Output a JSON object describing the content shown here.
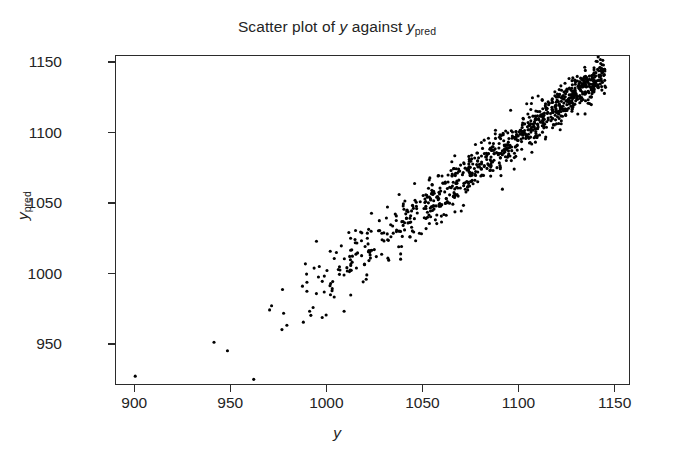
{
  "chart_data": {
    "type": "scatter",
    "title_parts": {
      "prefix": "Scatter plot of ",
      "var1": "y",
      "middle": " against ",
      "var2": "y",
      "var2_sub": "pred"
    },
    "xlabel": "y",
    "ylabel": "y_pred",
    "ylabel_parts": {
      "base": "y",
      "sub": "pred"
    },
    "xlim": [
      890,
      1158
    ],
    "ylim": [
      921,
      1155
    ],
    "xticks": [
      900,
      950,
      1000,
      1050,
      1100,
      1150
    ],
    "xticklabels": [
      "900",
      "950",
      "1000",
      "1050",
      "1100",
      "1150"
    ],
    "yticks": [
      950,
      1000,
      1050,
      1100,
      1150
    ],
    "yticklabels": [
      "950",
      "1000",
      "1050",
      "1100",
      "1150"
    ],
    "grid": false,
    "legend": null,
    "marker": {
      "shape": "circle",
      "color": "#000000",
      "size_px": 3.1
    },
    "frame": {
      "box": true,
      "color": "#2b2b2b"
    },
    "n_points": 950,
    "relationship": "strong positive linear, heteroscedastic (tight at high values, dispersed at low values)",
    "correlation_approx": 0.97,
    "point_generation": {
      "model": "y_pred = y + noise",
      "x_distribution": "beta-like, concentrated toward upper range",
      "x_min": 958,
      "x_max": 1145,
      "x_mode": 1090,
      "noise_sd_at_xmin": 14.0,
      "noise_sd_at_xmax": 5.5,
      "seed": 20240517
    },
    "outliers": [
      {
        "x": 900,
        "y": 928,
        "note": "isolated point at far lower-left corner"
      },
      {
        "x": 941,
        "y": 952,
        "note": "lower-left sparse tail"
      },
      {
        "x": 948,
        "y": 946,
        "note": "lower-left sparse tail"
      }
    ]
  }
}
